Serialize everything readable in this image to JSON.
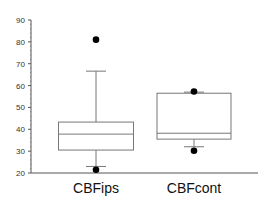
{
  "chart_data": {
    "type": "box",
    "title": "",
    "xlabel": "",
    "ylabel": "",
    "ylim": [
      20,
      90
    ],
    "yticks": [
      20,
      30,
      40,
      50,
      60,
      70,
      80,
      90
    ],
    "grid": false,
    "legend": null,
    "categories": [
      "CBFips",
      "CBFcont"
    ],
    "series": [
      {
        "name": "CBFips",
        "whisker_low": 23,
        "q1": 30.5,
        "median": 37.8,
        "q3": 43.3,
        "whisker_high": 66.6,
        "outliers": [
          81,
          21.5
        ]
      },
      {
        "name": "CBFcont",
        "whisker_low": 32,
        "q1": 35.5,
        "median": 38.2,
        "q3": 56.5,
        "whisker_high": 57,
        "outliers": [
          57.3,
          30.2
        ]
      }
    ]
  },
  "colors": {
    "axis": "#555555",
    "box": "#777777",
    "dot": "#000000"
  }
}
